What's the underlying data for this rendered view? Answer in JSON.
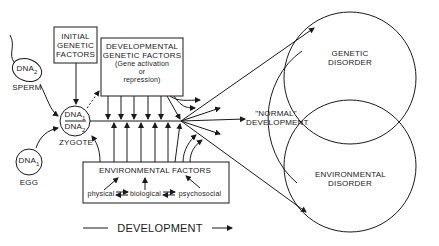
{
  "diagram": {
    "sperm": {
      "dna": "DNA",
      "sub": "2",
      "label": "SPERM"
    },
    "egg": {
      "dna": "DNA",
      "sub": "1",
      "label": "EGG"
    },
    "zygote": {
      "top": "DNA",
      "top_sub": "1",
      "bottom": "DNA",
      "bottom_sub": "2",
      "label": "ZYGOTE"
    },
    "initial_genetic": {
      "line1": "INITIAL",
      "line2": "GENETIC",
      "line3": "FACTORS"
    },
    "developmental_genetic": {
      "line1": "DEVELOPMENTAL",
      "line2": "GENETIC  FACTORS",
      "line3": "(Gene  activation",
      "line4": "or",
      "line5": "repression)"
    },
    "environmental": {
      "title": "ENVIRONMENTAL   FACTORS",
      "physical": "physical",
      "biological": "biological",
      "psychosocial": "psychosocial"
    },
    "normal": {
      "line1": "\"NORMAL\"",
      "line2": "DEVELOPMENT"
    },
    "genetic_disorder": {
      "line1": "GENETIC",
      "line2": "DISORDER"
    },
    "environmental_disorder": {
      "line1": "ENVIRONMENTAL",
      "line2": "DISORDER"
    },
    "axis_label": "DEVELOPMENT"
  }
}
